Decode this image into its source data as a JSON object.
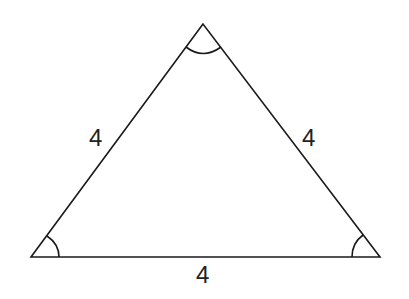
{
  "diagram": {
    "type": "equilateral-triangle",
    "vertices": {
      "apex": [
        203,
        24
      ],
      "bottom_left": [
        31,
        257
      ],
      "bottom_right": [
        380,
        257
      ]
    },
    "side_labels": {
      "left": "4",
      "right": "4",
      "bottom": "4"
    },
    "angle_marks": [
      "apex",
      "bottom_left",
      "bottom_right"
    ],
    "stroke_color": "#1a1a1a",
    "background": "#ffffff"
  }
}
